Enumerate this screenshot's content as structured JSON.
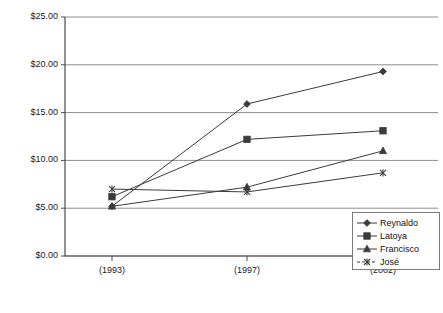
{
  "chart_data": {
    "type": "line",
    "title": "",
    "xlabel": "",
    "ylabel": "",
    "categories": [
      "(1993)",
      "(1997)",
      "(2002)"
    ],
    "x": [
      "(1993)",
      "(1997)",
      "(2002)"
    ],
    "ylim": [
      0,
      25
    ],
    "yticks": [
      0,
      5,
      10,
      15,
      20,
      25
    ],
    "ytick_labels": [
      "$0.00",
      "$5.00",
      "$10.00",
      "$15.00",
      "$20.00",
      "$25.00"
    ],
    "grid": true,
    "legend_position": "lower-right inside plot",
    "series": [
      {
        "name": "Reynaldo",
        "marker": "diamond",
        "values": [
          5.2,
          15.9,
          19.3
        ]
      },
      {
        "name": "Latoya",
        "marker": "square",
        "values": [
          6.2,
          12.2,
          13.1
        ]
      },
      {
        "name": "Francisco",
        "marker": "triangle",
        "values": [
          5.2,
          7.2,
          11.0
        ]
      },
      {
        "name": "José",
        "marker": "x",
        "values": [
          7.0,
          6.7,
          8.7
        ]
      }
    ]
  },
  "legend": {
    "items": [
      {
        "label": "Reynaldo",
        "marker": "diamond-marker-icon"
      },
      {
        "label": "Latoya",
        "marker": "square-marker-icon"
      },
      {
        "label": "Francisco",
        "marker": "triangle-marker-icon"
      },
      {
        "label": "José",
        "marker": "x-marker-icon"
      }
    ]
  },
  "axes": {
    "y_tick_labels": [
      "$25.00",
      "$20.00",
      "$15.00",
      "$10.00",
      "$5.00",
      "$0.00"
    ],
    "x_tick_labels": [
      "(1993)",
      "(1997)",
      "(2002)"
    ]
  },
  "colors": {
    "series_line": "#3b3b3b",
    "grid": "#8d8d8d",
    "axis": "#4a4a4a",
    "text": "#1a1a1a",
    "background": "#ffffff"
  }
}
